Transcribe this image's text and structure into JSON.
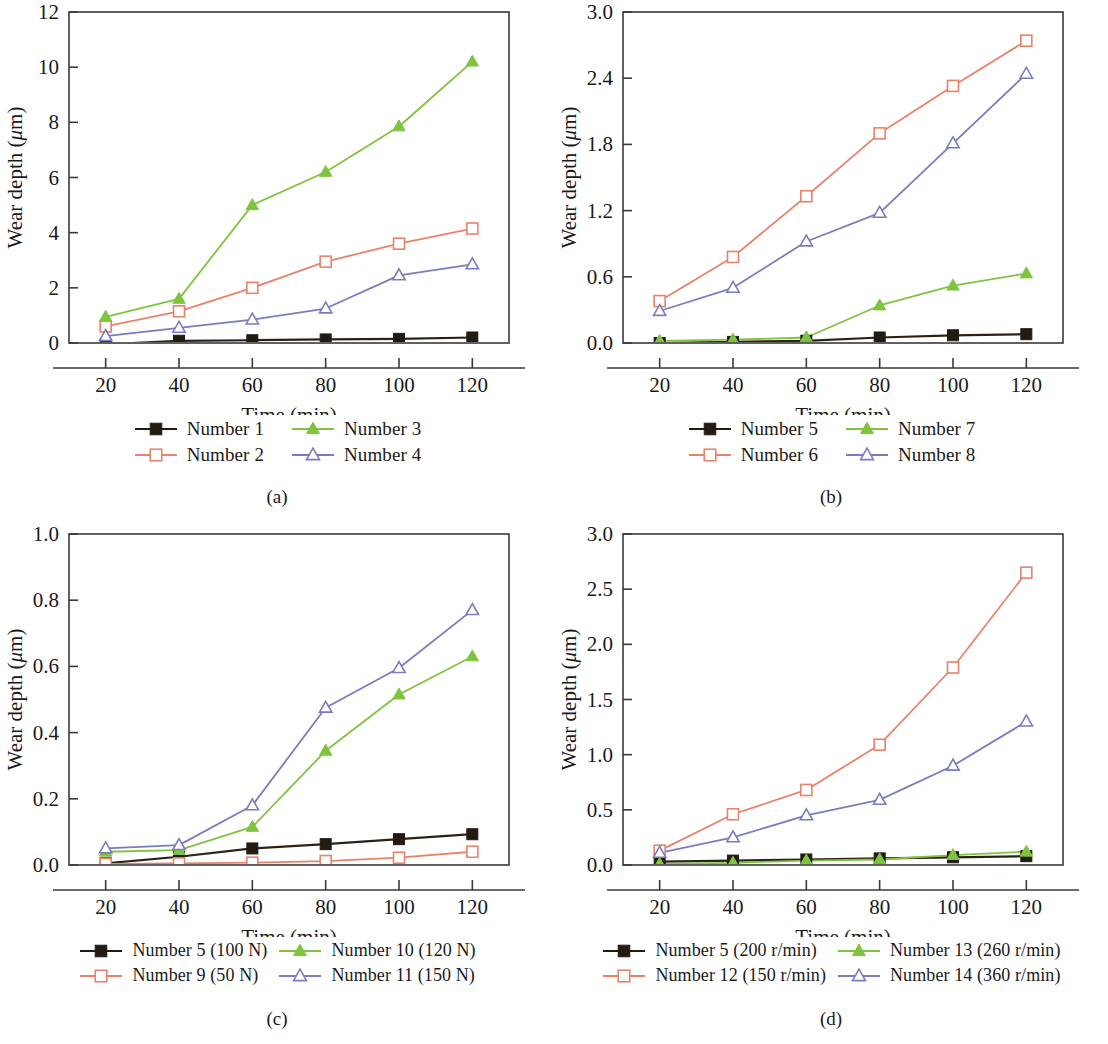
{
  "figure": {
    "panels": [
      {
        "caption": "(a)",
        "xlabel": "Time (min)",
        "ylabel": "Wear depth (μm)",
        "chart_data": {
          "type": "line",
          "title": "",
          "xlabel": "Time (min)",
          "ylabel": "Wear depth (μm)",
          "x": [
            20,
            40,
            60,
            80,
            100,
            120
          ],
          "xticks": [
            "20",
            "40",
            "60",
            "80",
            "100",
            "120"
          ],
          "xlim": [
            10,
            130
          ],
          "ylim": [
            0,
            12
          ],
          "yticks": [
            "0",
            "2",
            "4",
            "6",
            "8",
            "10",
            "12"
          ],
          "ytickvals": [
            0,
            2,
            4,
            6,
            8,
            10,
            12
          ],
          "grid": false,
          "legend_position": "below",
          "series": [
            {
              "name": "Number 1",
              "marker": "filled-square",
              "color": "#2b2118",
              "values": [
                -0.05,
                0.08,
                0.1,
                0.13,
                0.15,
                0.2
              ]
            },
            {
              "name": "Number 2",
              "marker": "open-square",
              "color": "#e8836b",
              "values": [
                0.6,
                1.15,
                2.0,
                2.95,
                3.6,
                4.15
              ]
            },
            {
              "name": "Number 3",
              "marker": "filled-triangle",
              "color": "#7fc43f",
              "values": [
                0.95,
                1.6,
                5.0,
                6.2,
                7.85,
                10.2
              ]
            },
            {
              "name": "Number 4",
              "marker": "open-triangle",
              "color": "#7b7bc0",
              "values": [
                0.25,
                0.55,
                0.85,
                1.25,
                2.45,
                2.85
              ]
            }
          ]
        }
      },
      {
        "caption": "(b)",
        "xlabel": "Time (min)",
        "ylabel": "Wear depth (μm)",
        "chart_data": {
          "type": "line",
          "title": "",
          "xlabel": "Time (min)",
          "ylabel": "Wear depth (μm)",
          "x": [
            20,
            40,
            60,
            80,
            100,
            120
          ],
          "xticks": [
            "20",
            "40",
            "60",
            "80",
            "100",
            "120"
          ],
          "xlim": [
            10,
            130
          ],
          "ylim": [
            0,
            3.0
          ],
          "yticks": [
            "0.0",
            "0.6",
            "1.2",
            "1.8",
            "2.4",
            "3.0"
          ],
          "ytickvals": [
            0.0,
            0.6,
            1.2,
            1.8,
            2.4,
            3.0
          ],
          "grid": false,
          "legend_position": "below",
          "series": [
            {
              "name": "Number 5",
              "marker": "filled-square",
              "color": "#2b2118",
              "values": [
                0.0,
                0.01,
                0.02,
                0.05,
                0.07,
                0.08
              ]
            },
            {
              "name": "Number 6",
              "marker": "open-square",
              "color": "#e8836b",
              "values": [
                0.38,
                0.78,
                1.33,
                1.9,
                2.33,
                2.74
              ]
            },
            {
              "name": "Number 7",
              "marker": "filled-triangle",
              "color": "#7fc43f",
              "values": [
                0.02,
                0.03,
                0.05,
                0.34,
                0.52,
                0.63
              ]
            },
            {
              "name": "Number 8",
              "marker": "open-triangle",
              "color": "#7b7bc0",
              "values": [
                0.29,
                0.5,
                0.92,
                1.18,
                1.81,
                2.44
              ]
            }
          ]
        }
      },
      {
        "caption": "(c)",
        "xlabel": "Time (min)",
        "ylabel": "Wear depth (μm)",
        "chart_data": {
          "type": "line",
          "title": "",
          "xlabel": "Time (min)",
          "ylabel": "Wear depth (μm)",
          "x": [
            20,
            40,
            60,
            80,
            100,
            120
          ],
          "xticks": [
            "20",
            "40",
            "60",
            "80",
            "100",
            "120"
          ],
          "xlim": [
            10,
            130
          ],
          "ylim": [
            0,
            1.0
          ],
          "yticks": [
            "0.0",
            "0.2",
            "0.4",
            "0.6",
            "0.8",
            "1.0"
          ],
          "ytickvals": [
            0.0,
            0.2,
            0.4,
            0.6,
            0.8,
            1.0
          ],
          "grid": false,
          "legend_position": "below",
          "series": [
            {
              "name": "Number 5 (100 N)",
              "marker": "filled-square",
              "color": "#2b2118",
              "values": [
                0.005,
                0.025,
                0.05,
                0.063,
                0.078,
                0.093
              ]
            },
            {
              "name": "Number 9 (50 N)",
              "marker": "open-square",
              "color": "#e8836b",
              "values": [
                0.003,
                0.005,
                0.007,
                0.012,
                0.022,
                0.04
              ]
            },
            {
              "name": "Number 10 (120 N)",
              "marker": "filled-triangle",
              "color": "#7fc43f",
              "values": [
                0.04,
                0.045,
                0.115,
                0.345,
                0.515,
                0.63
              ]
            },
            {
              "name": "Number 11 (150 N)",
              "marker": "open-triangle",
              "color": "#7b7bc0",
              "values": [
                0.05,
                0.06,
                0.18,
                0.475,
                0.595,
                0.77
              ]
            }
          ]
        }
      },
      {
        "caption": "(d)",
        "xlabel": "Time (min)",
        "ylabel": "Wear depth (μm)",
        "chart_data": {
          "type": "line",
          "title": "",
          "xlabel": "Time (min)",
          "ylabel": "Wear depth (μm)",
          "x": [
            20,
            40,
            60,
            80,
            100,
            120
          ],
          "xticks": [
            "20",
            "40",
            "60",
            "80",
            "100",
            "120"
          ],
          "xlim": [
            10,
            130
          ],
          "ylim": [
            0,
            3.0
          ],
          "yticks": [
            "0.0",
            "0.5",
            "1.0",
            "1.5",
            "2.0",
            "2.5",
            "3.0"
          ],
          "ytickvals": [
            0.0,
            0.5,
            1.0,
            1.5,
            2.0,
            2.5,
            3.0
          ],
          "grid": false,
          "legend_position": "below",
          "series": [
            {
              "name": "Number 5 (200 r/min)",
              "marker": "filled-square",
              "color": "#2b2118",
              "values": [
                0.03,
                0.04,
                0.05,
                0.06,
                0.07,
                0.08
              ]
            },
            {
              "name": "Number 12 (150 r/min)",
              "marker": "open-square",
              "color": "#e8836b",
              "values": [
                0.13,
                0.46,
                0.68,
                1.09,
                1.79,
                2.65
              ]
            },
            {
              "name": "Number 13 (260 r/min)",
              "marker": "filled-triangle",
              "color": "#7fc43f",
              "values": [
                0.01,
                0.02,
                0.04,
                0.05,
                0.09,
                0.12
              ]
            },
            {
              "name": "Number 14 (360 r/min)",
              "marker": "open-triangle",
              "color": "#7b7bc0",
              "values": [
                0.11,
                0.25,
                0.45,
                0.59,
                0.9,
                1.3
              ]
            }
          ]
        }
      }
    ]
  }
}
